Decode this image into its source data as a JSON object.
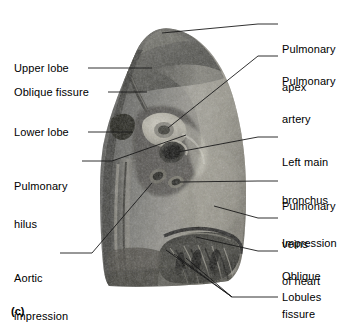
{
  "figure": {
    "panel_id": "(c)",
    "specimen": "left lung medial surface photograph",
    "background_color": "#ffffff",
    "leader_color": "#1a1a1a",
    "text_color": "#000000"
  },
  "labels_left": [
    {
      "name": "upper-lobe",
      "lines": [
        "Upper lobe"
      ],
      "x": 14,
      "y": 62,
      "leader": [
        [
          88,
          68
        ],
        [
          152,
          68
        ]
      ]
    },
    {
      "name": "oblique-fissure",
      "lines": [
        "Oblique fissure"
      ],
      "x": 14,
      "y": 86,
      "leader": [
        [
          108,
          92
        ],
        [
          147,
          92
        ]
      ]
    },
    {
      "name": "lower-lobe",
      "lines": [
        "Lower lobe"
      ],
      "x": 14,
      "y": 126,
      "leader": [
        [
          88,
          132
        ],
        [
          133,
          132
        ]
      ]
    },
    {
      "name": "pulmonary-hilus",
      "lines": [
        "Pulmonary",
        "hilus"
      ],
      "x": 14,
      "y": 155,
      "leader": [
        [
          82,
          161
        ],
        [
          112,
          161
        ]
      ]
    },
    {
      "name": "aortic-impression",
      "lines": [
        "Aortic",
        "impression"
      ],
      "x": 14,
      "y": 247,
      "leader": [
        [
          60,
          253
        ],
        [
          88,
          253
        ]
      ]
    }
  ],
  "labels_right": [
    {
      "name": "pulmonary-apex",
      "lines": [
        "Pulmonary",
        "apex"
      ],
      "x": 282,
      "y": 18,
      "leader": [
        [
          258,
          24
        ],
        [
          278,
          24
        ]
      ]
    },
    {
      "name": "pulmonary-artery",
      "lines": [
        "Pulmonary",
        "artery"
      ],
      "x": 282,
      "y": 50,
      "leader": [
        [
          258,
          56
        ],
        [
          278,
          56
        ]
      ]
    },
    {
      "name": "left-main-bronchus",
      "lines": [
        "Left main",
        "bronchus"
      ],
      "x": 282,
      "y": 131,
      "leader": [
        [
          258,
          137
        ],
        [
          278,
          137
        ]
      ]
    },
    {
      "name": "pulmonary-veins",
      "lines": [
        "Pulmonary",
        "veins"
      ],
      "x": 282,
      "y": 175,
      "leader": [
        [
          258,
          181
        ],
        [
          278,
          181
        ]
      ]
    },
    {
      "name": "impression-of-heart",
      "lines": [
        "Impression",
        "of heart"
      ],
      "x": 282,
      "y": 212,
      "leader": [
        [
          258,
          218
        ],
        [
          278,
          218
        ]
      ]
    },
    {
      "name": "oblique-fissure-2",
      "lines": [
        "Oblique",
        "fissure"
      ],
      "x": 282,
      "y": 245,
      "leader": [
        [
          258,
          251
        ],
        [
          278,
          251
        ]
      ]
    },
    {
      "name": "lobules",
      "lines": [
        "Lobules"
      ],
      "x": 282,
      "y": 291,
      "leader": [
        [
          258,
          297
        ],
        [
          278,
          297
        ]
      ]
    }
  ]
}
